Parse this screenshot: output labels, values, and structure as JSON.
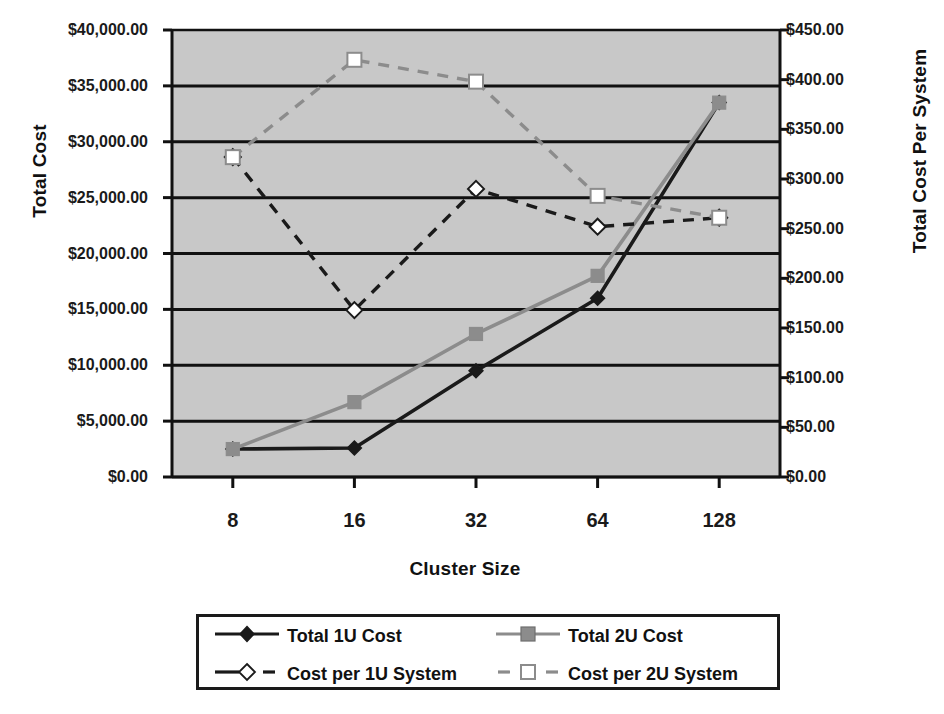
{
  "chart_data": {
    "type": "line",
    "title": "",
    "xlabel": "Cluster Size",
    "ylabel": "Total Cost",
    "y2label": "Total Cost Per System",
    "categories": [
      "8",
      "16",
      "32",
      "64",
      "128"
    ],
    "x": [
      8,
      16,
      32,
      64,
      128
    ],
    "ylim": [
      0,
      40000
    ],
    "y2lim": [
      0,
      450
    ],
    "yticks": [
      "$0.00",
      "$5,000.00",
      "$10,000.00",
      "$15,000.00",
      "$20,000.00",
      "$25,000.00",
      "$30,000.00",
      "$35,000.00",
      "$40,000.00"
    ],
    "ytick_values": [
      0,
      5000,
      10000,
      15000,
      20000,
      25000,
      30000,
      35000,
      40000
    ],
    "y2ticks": [
      "$0.00",
      "$50.00",
      "$100.00",
      "$150.00",
      "$200.00",
      "$250.00",
      "$300.00",
      "$350.00",
      "$400.00",
      "$450.00"
    ],
    "y2tick_values": [
      0,
      50,
      100,
      150,
      200,
      250,
      300,
      350,
      400,
      450
    ],
    "grid": "horizontal",
    "plot_background": "#c8c8c8",
    "legend_position": "bottom",
    "series": [
      {
        "name": "Total 1U Cost",
        "axis": "left",
        "color": "#1a1a1a",
        "marker": "diamond",
        "marker_fill": "#1a1a1a",
        "dash": "solid",
        "values": [
          2500,
          2600,
          9500,
          16000,
          33500
        ]
      },
      {
        "name": "Total 2U Cost",
        "axis": "left",
        "color": "#8c8c8c",
        "marker": "square",
        "marker_fill": "#8c8c8c",
        "dash": "solid",
        "values": [
          2500,
          6700,
          12800,
          18000,
          33500
        ]
      },
      {
        "name": "Cost per 1U System",
        "axis": "right",
        "color": "#1a1a1a",
        "marker": "diamond",
        "marker_fill": "#ffffff",
        "dash": "dashed",
        "values": [
          322,
          168,
          290,
          252,
          261
        ]
      },
      {
        "name": "Cost per 2U System",
        "axis": "right",
        "color": "#8c8c8c",
        "marker": "square",
        "marker_fill": "#ffffff",
        "dash": "dashed",
        "values": [
          322,
          420,
          398,
          283,
          261
        ]
      }
    ]
  },
  "legend": {
    "items": [
      {
        "label": "Total 1U Cost"
      },
      {
        "label": "Total 2U Cost"
      },
      {
        "label": "Cost per 1U System"
      },
      {
        "label": "Cost per 2U System"
      }
    ]
  },
  "colors": {
    "series_1u": "#1a1a1a",
    "series_2u": "#8c8c8c",
    "plot_bg": "#c8c8c8",
    "axis": "#111111"
  }
}
